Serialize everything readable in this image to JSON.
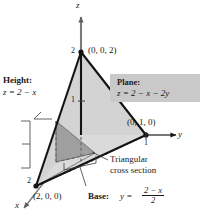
{
  "figure": {
    "title_alt": "Tetrahedron bounded by the plane z = 2 - x - 2y and the coordinate planes",
    "colors": {
      "face_light": "#dcdcdc",
      "face_mid": "#cfcfcf",
      "cross_section": "#9e9e9e",
      "box_bg": "#c9c9c9",
      "axis": "#6e6e6e",
      "edge": "#1a1a1a",
      "background": "#ffffff"
    }
  },
  "axes": {
    "z_label": "z",
    "y_label": "y",
    "x_label": "x",
    "ticks": {
      "z_two": "2",
      "z_one": "1",
      "y_one": "1",
      "x_two": "2"
    }
  },
  "vertices": {
    "apex": "(0, 0, 2)",
    "y_intercept": "(0, 1, 0)",
    "x_intercept": "(2, 0, 0)"
  },
  "annotations": {
    "height": {
      "title": "Height:",
      "equation": "z = 2 − x"
    },
    "plane": {
      "title": "Plane:",
      "equation": "z = 2 − x − 2y"
    },
    "cross_section": {
      "line1": "Triangular",
      "line2": "cross section"
    },
    "base": {
      "title": "Base:",
      "lhs": "y =",
      "numerator": "2 − x",
      "denominator": "2"
    }
  }
}
